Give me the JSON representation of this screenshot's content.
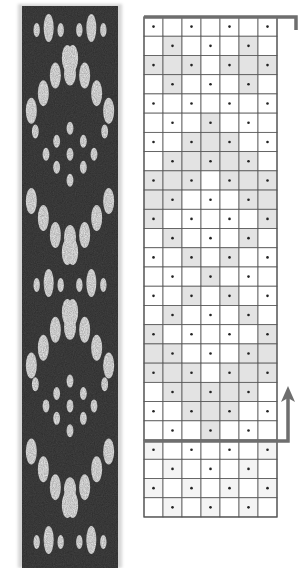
{
  "figure": {
    "band": {
      "background_color": "#2b2b2b",
      "pattern_color": "#f2f2f2",
      "x": 22,
      "y": 6,
      "width": 96,
      "height": 562,
      "motifs": [
        {
          "type": "eyes",
          "cy": 28
        },
        {
          "type": "chevron-up",
          "apex_y": 58,
          "base_y": 120
        },
        {
          "type": "dot-diamond",
          "top_y": 125,
          "bottom_y": 190
        },
        {
          "type": "chevron-down",
          "top_y": 192,
          "apex_y": 252
        },
        {
          "type": "eyes",
          "cy": 283
        },
        {
          "type": "chevron-up",
          "apex_y": 312,
          "base_y": 375
        },
        {
          "type": "dot-diamond",
          "top_y": 378,
          "bottom_y": 440
        },
        {
          "type": "chevron-down",
          "top_y": 442,
          "apex_y": 505
        },
        {
          "type": "eyes",
          "cy": 540
        }
      ]
    },
    "chart": {
      "columns": 7,
      "rows": 26,
      "x": 144,
      "y": 17,
      "cell_width": 19,
      "cell_height": 19.23,
      "grid_color": "#555555",
      "shade_color": "#e3e3e3",
      "faint_shade_color": "#f4f4f4",
      "dot_color": "#222222",
      "dots_note": "odd rows dotted in columns 1,3,5,7; even rows in columns 2,4,6",
      "shaded_cells": [
        [],
        [
          2,
          6
        ],
        [
          1,
          2,
          3,
          5,
          6,
          7
        ],
        [
          2,
          6
        ],
        [],
        [
          4
        ],
        [
          3,
          4,
          5
        ],
        [
          2,
          3,
          4,
          5,
          6
        ],
        [
          1,
          2,
          3,
          5,
          6,
          7
        ],
        [
          1,
          2,
          6,
          7
        ],
        [
          1,
          7
        ],
        [
          2,
          6
        ],
        [
          3,
          5
        ],
        [
          4
        ],
        [
          3,
          5
        ],
        [
          2,
          6
        ],
        [
          1,
          7
        ],
        [
          1,
          2,
          6,
          7
        ],
        [
          1,
          2,
          3,
          5,
          6,
          7
        ],
        [
          2,
          3,
          4,
          5,
          6
        ],
        [
          3,
          4,
          5
        ],
        [
          4
        ],
        [
          1,
          7
        ],
        [
          2,
          6
        ],
        [
          1,
          3,
          5,
          7
        ],
        [
          2,
          4,
          6
        ]
      ],
      "faint_rows": [
        23,
        24,
        25,
        26
      ],
      "top_bracket": {
        "x1": 144,
        "x2": 296,
        "y": 17,
        "drop_to_y": 30,
        "color": "#6e6e6e"
      },
      "repeat_arrow": {
        "from_x": 144,
        "y": 441,
        "to_x": 288,
        "tip_y": 386,
        "color": "#6e6e6e",
        "label": "repeat-arrow"
      }
    }
  }
}
